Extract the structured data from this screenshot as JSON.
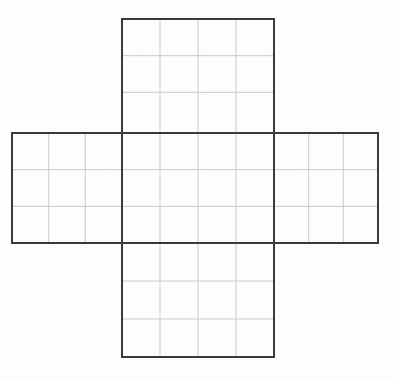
{
  "figure": {
    "title": "",
    "kind": "cube-net-grid",
    "background_color": "#fdfdfd",
    "outline_color": "#3a3a3a",
    "gridline_color": "#c9c9c9",
    "outline_width": 2,
    "gridline_width": 1,
    "cell_width": 38,
    "cell_height": 36.7,
    "canvas": {
      "width": 399,
      "height": 380
    }
  },
  "geometry": {
    "guides_x": [
      12,
      48.7,
      85.3,
      122,
      160,
      198,
      236,
      274,
      308.7,
      343.3,
      378
    ],
    "guides_y": [
      19,
      55.7,
      92.3,
      133,
      169.7,
      206.3,
      243,
      281,
      319,
      357
    ],
    "panels": [
      {
        "name": "top-face",
        "label": "",
        "x": 122,
        "y": 19,
        "width": 152,
        "height": 114,
        "cols": 4,
        "rows": 3,
        "col_lines": [
          160,
          198,
          236
        ],
        "row_lines": [
          55.7,
          92.3
        ]
      },
      {
        "name": "left-face",
        "label": "",
        "x": 12,
        "y": 133,
        "width": 110,
        "height": 110,
        "cols": 3,
        "rows": 3,
        "col_lines": [
          48.7,
          85.3
        ],
        "row_lines": [
          169.7,
          206.3
        ]
      },
      {
        "name": "center-face",
        "label": "",
        "x": 122,
        "y": 133,
        "width": 152,
        "height": 110,
        "cols": 4,
        "rows": 3,
        "col_lines": [
          160,
          198,
          236
        ],
        "row_lines": [
          169.7,
          206.3
        ]
      },
      {
        "name": "right-face",
        "label": "",
        "x": 274,
        "y": 133,
        "width": 104,
        "height": 110,
        "cols": 3,
        "rows": 3,
        "col_lines": [
          308.7,
          343.3
        ],
        "row_lines": [
          169.7,
          206.3
        ]
      },
      {
        "name": "bottom-face",
        "label": "",
        "x": 122,
        "y": 243,
        "width": 152,
        "height": 114,
        "cols": 4,
        "rows": 3,
        "col_lines": [
          160,
          198,
          236
        ],
        "row_lines": [
          281,
          319
        ]
      }
    ],
    "outline_path": "M 122 19 L 274 19 L 274 133 L 378 133 L 378 243 L 274 243 L 274 357 L 122 357 L 122 243 L 12 243 L 12 133 L 122 133 Z",
    "internal_outline_segments": [
      {
        "name": "center-top-edge",
        "x1": 122,
        "y1": 133,
        "x2": 274,
        "y2": 133
      },
      {
        "name": "center-bottom-edge",
        "x1": 122,
        "y1": 243,
        "x2": 274,
        "y2": 243
      },
      {
        "name": "center-left-edge",
        "x1": 122,
        "y1": 133,
        "x2": 122,
        "y2": 243
      },
      {
        "name": "center-right-edge",
        "x1": 274,
        "y1": 133,
        "x2": 274,
        "y2": 243
      }
    ]
  }
}
